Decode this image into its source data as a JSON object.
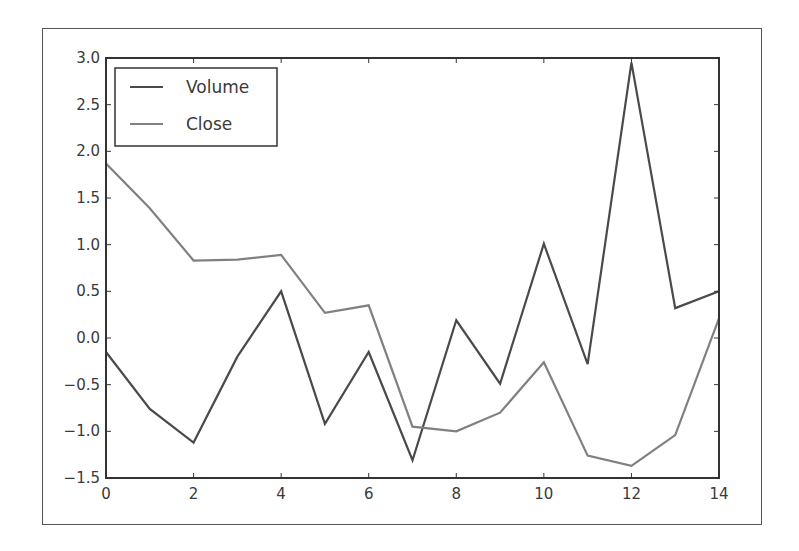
{
  "chart_data": {
    "type": "line",
    "title": "",
    "xlabel": "",
    "ylabel": "",
    "x": [
      0,
      1,
      2,
      3,
      4,
      5,
      6,
      7,
      8,
      9,
      10,
      11,
      12,
      13,
      14
    ],
    "series": [
      {
        "name": "Volume",
        "color": "#4a4a4a",
        "values": [
          -0.15,
          -0.76,
          -1.12,
          -0.2,
          0.5,
          -0.92,
          -0.15,
          -1.31,
          0.19,
          -0.49,
          1.01,
          -0.28,
          2.95,
          0.32,
          0.5
        ]
      },
      {
        "name": "Close",
        "color": "#808080",
        "values": [
          1.87,
          1.39,
          0.83,
          0.84,
          0.89,
          0.27,
          0.35,
          -0.95,
          -1.0,
          -0.8,
          -0.26,
          -1.26,
          -1.37,
          -1.04,
          0.21
        ]
      }
    ],
    "xlim": [
      0,
      14
    ],
    "ylim": [
      -1.5,
      3.0
    ],
    "xticks": [
      0,
      2,
      4,
      6,
      8,
      10,
      12,
      14
    ],
    "xtick_labels": [
      "0",
      "2",
      "4",
      "6",
      "8",
      "10",
      "12",
      "14"
    ],
    "yticks": [
      -1.5,
      -1.0,
      -0.5,
      0.0,
      0.5,
      1.0,
      1.5,
      2.0,
      2.5,
      3.0
    ],
    "ytick_labels": [
      "−1.5",
      "−1.0",
      "−0.5",
      "0.0",
      "0.5",
      "1.0",
      "1.5",
      "2.0",
      "2.5",
      "3.0"
    ],
    "grid": false,
    "legend_position": "upper left",
    "legend": [
      "Volume",
      "Close"
    ]
  }
}
